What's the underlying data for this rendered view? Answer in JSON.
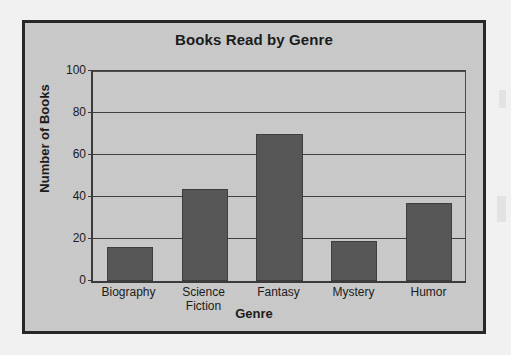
{
  "chart_data": {
    "type": "bar",
    "title": "Books Read by Genre",
    "xlabel": "Genre",
    "ylabel": "Number of Books",
    "categories": [
      "Biography",
      "Science Fiction",
      "Fantasy",
      "Mystery",
      "Humor"
    ],
    "category_lines": [
      [
        "Biography"
      ],
      [
        "Science",
        "Fiction"
      ],
      [
        "Fantasy"
      ],
      [
        "Mystery"
      ],
      [
        "Humor"
      ]
    ],
    "values": [
      16,
      44,
      70,
      19,
      37
    ],
    "ylim": [
      0,
      100
    ],
    "yticks": [
      0,
      20,
      40,
      60,
      80,
      100
    ],
    "ytick_labels": [
      "0",
      "20",
      "40",
      "60",
      "80",
      "100"
    ],
    "grid": true,
    "grid_axis": "y",
    "legend": false,
    "bar_color": "#565656",
    "plot_background": "#c9c9c9",
    "frame_color": "#262626",
    "text_color": "#1a1a1a"
  }
}
